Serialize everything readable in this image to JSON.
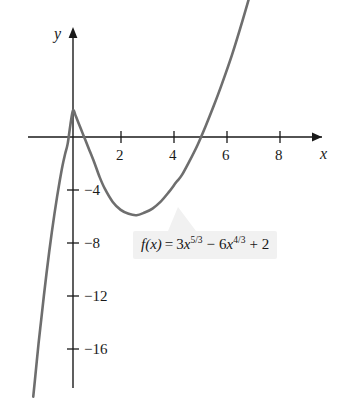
{
  "chart_data": {
    "type": "line",
    "title": "",
    "xlabel": "x",
    "ylabel": "y",
    "xlim": [
      -1.5,
      10.2
    ],
    "ylim": [
      -19.5,
      6.5
    ],
    "grid": false,
    "legend": "none",
    "equation_text": "f(x) = 3x^5/3 - 6x^4/3 + 2",
    "equation_parts": {
      "fx": "f(x)",
      "equals": "=",
      "term1_coef": "3",
      "term1_var": "x",
      "term1_exp": "5/3",
      "minus": "−",
      "term2_coef": "6",
      "term2_var": "x",
      "term2_exp": "4/3",
      "plus": "+",
      "constant": "2"
    },
    "x_ticks": [
      {
        "value": 2,
        "label": "2"
      },
      {
        "value": 4,
        "label": "4"
      },
      {
        "value": 6,
        "label": "6"
      },
      {
        "value": 8,
        "label": "8"
      }
    ],
    "y_ticks": [
      {
        "value": -4,
        "label": "−4"
      },
      {
        "value": -8,
        "label": "−8"
      },
      {
        "value": -12,
        "label": "−12"
      },
      {
        "value": -16,
        "label": "−16"
      }
    ],
    "features": {
      "local_maximum": {
        "x": 0,
        "y": 2
      },
      "local_minimum": {
        "x": 4.1,
        "y": -5.4
      },
      "x_intercepts": [
        -0.33,
        0.52,
        7.52
      ]
    },
    "series": [
      {
        "name": "f(x) = 3x^(5/3) - 6x^(4/3) + 2",
        "color": "#6e6e6e",
        "x": [
          -1.5,
          -1.4,
          -1.3,
          -1.2,
          -1.1,
          -1.0,
          -0.9,
          -0.8,
          -0.7,
          -0.6,
          -0.5,
          -0.4,
          -0.3,
          -0.2,
          -0.1,
          0.0,
          0.1,
          0.2,
          0.3,
          0.4,
          0.5,
          0.6,
          0.8,
          1.0,
          1.2,
          1.5,
          1.8,
          2.1,
          2.4,
          2.7,
          3.0,
          3.3,
          3.6,
          3.9,
          4.1,
          4.4,
          4.7,
          5.0,
          5.3,
          5.6,
          6.0,
          6.4,
          6.8,
          7.2,
          7.6,
          8.0,
          8.4,
          8.8,
          9.2,
          9.6,
          10.0
        ],
        "y": [
          -19.6,
          -17.6,
          -15.6,
          -13.8,
          -12.0,
          -10.3,
          -8.7,
          -7.2,
          -5.8,
          -4.5,
          -3.3,
          -2.2,
          -1.3,
          -0.5,
          0.9,
          2.0,
          1.6,
          1.1,
          0.6,
          0.1,
          -0.4,
          -0.9,
          -1.9,
          -3.0,
          -3.9,
          -4.9,
          -5.5,
          -5.8,
          -5.9,
          -5.7,
          -5.4,
          -4.9,
          -4.2,
          -3.4,
          -2.9,
          -1.8,
          -0.6,
          0.8,
          2.3,
          3.9,
          6.2,
          8.8,
          11.6,
          14.6,
          17.9,
          21.4,
          25.1,
          29.0,
          33.2,
          37.6,
          42.2
        ]
      }
    ]
  },
  "axes": {
    "y_axis_name": "y",
    "x_axis_name": "x"
  }
}
